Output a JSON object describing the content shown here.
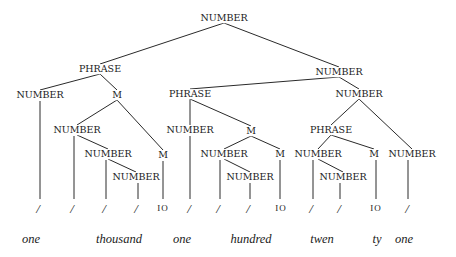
{
  "diagram": {
    "type": "parse-tree",
    "nodes": [
      {
        "id": "n0",
        "label": "NUMBER",
        "x": 224,
        "y": 18
      },
      {
        "id": "n1",
        "label": "PHRASE",
        "x": 100,
        "y": 69
      },
      {
        "id": "n2",
        "label": "NUMBER",
        "x": 40,
        "y": 95
      },
      {
        "id": "n3",
        "label": "M",
        "x": 117,
        "y": 95
      },
      {
        "id": "n4",
        "label": "NUMBER",
        "x": 77,
        "y": 130
      },
      {
        "id": "n5",
        "label": "NUMBER",
        "x": 108,
        "y": 154
      },
      {
        "id": "n6",
        "label": "NUMBER",
        "x": 136,
        "y": 177
      },
      {
        "id": "n7",
        "label": "M",
        "x": 163,
        "y": 155
      },
      {
        "id": "n8",
        "label": "NUMBER",
        "x": 339,
        "y": 72
      },
      {
        "id": "n9",
        "label": "PHRASE",
        "x": 190,
        "y": 94
      },
      {
        "id": "n10",
        "label": "NUMBER",
        "x": 190,
        "y": 130
      },
      {
        "id": "n11",
        "label": "M",
        "x": 251,
        "y": 131
      },
      {
        "id": "n12",
        "label": "NUMBER",
        "x": 224,
        "y": 154
      },
      {
        "id": "n13",
        "label": "NUMBER",
        "x": 250,
        "y": 177
      },
      {
        "id": "n14",
        "label": "M",
        "x": 280,
        "y": 154
      },
      {
        "id": "n15",
        "label": "NUMBER",
        "x": 359,
        "y": 94
      },
      {
        "id": "n16",
        "label": "PHRASE",
        "x": 331,
        "y": 130
      },
      {
        "id": "n17",
        "label": "NUMBER",
        "x": 318,
        "y": 154
      },
      {
        "id": "n18",
        "label": "NUMBER",
        "x": 343,
        "y": 177
      },
      {
        "id": "n19",
        "label": "M",
        "x": 374,
        "y": 154
      },
      {
        "id": "n20",
        "label": "NUMBER",
        "x": 412,
        "y": 154
      }
    ],
    "edges": [
      [
        "n0",
        "n1"
      ],
      [
        "n0",
        "n8"
      ],
      [
        "n1",
        "n2"
      ],
      [
        "n1",
        "n3"
      ],
      [
        "n3",
        "n4"
      ],
      [
        "n3",
        "n7"
      ],
      [
        "n4",
        "n5"
      ],
      [
        "n5",
        "n6"
      ],
      [
        "n8",
        "n9"
      ],
      [
        "n8",
        "n15"
      ],
      [
        "n9",
        "n10"
      ],
      [
        "n9",
        "n11"
      ],
      [
        "n11",
        "n12"
      ],
      [
        "n11",
        "n14"
      ],
      [
        "n12",
        "n13"
      ],
      [
        "n15",
        "n16"
      ],
      [
        "n15",
        "n20"
      ],
      [
        "n16",
        "n17"
      ],
      [
        "n16",
        "n19"
      ],
      [
        "n17",
        "n18"
      ]
    ],
    "leaves": [
      {
        "parent": "n2",
        "symbol": "/",
        "x": 38,
        "line_x": 40
      },
      {
        "parent": "n4",
        "symbol": "/",
        "x": 72,
        "line_x": 74
      },
      {
        "parent": "n5",
        "symbol": "/",
        "x": 104,
        "line_x": 106
      },
      {
        "parent": "n6",
        "symbol": "/",
        "x": 136,
        "line_x": 138
      },
      {
        "parent": "n7",
        "symbol": "10",
        "x": 163,
        "line_x": 163
      },
      {
        "parent": "n10",
        "symbol": "/",
        "x": 189,
        "line_x": 190
      },
      {
        "parent": "n12",
        "symbol": "/",
        "x": 218,
        "line_x": 220
      },
      {
        "parent": "n13",
        "symbol": "/",
        "x": 248,
        "line_x": 250
      },
      {
        "parent": "n14",
        "symbol": "10",
        "x": 281,
        "line_x": 280
      },
      {
        "parent": "n17",
        "symbol": "/",
        "x": 311,
        "line_x": 313
      },
      {
        "parent": "n18",
        "symbol": "/",
        "x": 339,
        "line_x": 340
      },
      {
        "parent": "n19",
        "symbol": "10",
        "x": 376,
        "line_x": 376
      },
      {
        "parent": "n20",
        "symbol": "/",
        "x": 407,
        "line_x": 408
      }
    ],
    "words": [
      {
        "text": "one",
        "x": 31,
        "y": 239
      },
      {
        "text": "thousand",
        "x": 119,
        "y": 239
      },
      {
        "text": "one",
        "x": 182,
        "y": 239
      },
      {
        "text": "hundred",
        "x": 251,
        "y": 239
      },
      {
        "text": "twen",
        "x": 322,
        "y": 239
      },
      {
        "text": "ty",
        "x": 377,
        "y": 239
      },
      {
        "text": "one",
        "x": 404,
        "y": 239
      }
    ],
    "leaf_y": 208,
    "line_bottom": 199,
    "line_color": "#2a2a2a"
  }
}
